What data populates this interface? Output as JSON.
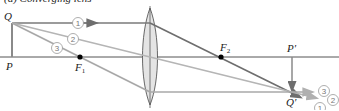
{
  "title": "(a) Converging lens",
  "labels": {
    "Q": "Q",
    "P": "P",
    "F1": "F",
    "F1_sub": "1",
    "F2": "F",
    "F2_sub": "2",
    "P_prime": "P′",
    "Q_prime": "Q′"
  },
  "rays": [
    {
      "id": "1",
      "label": "1",
      "color": "#7a7a7a"
    },
    {
      "id": "2",
      "label": "2",
      "color": "#b5b5b5"
    },
    {
      "id": "3",
      "label": "3",
      "color": "#a8a8a8"
    }
  ],
  "colors": {
    "axis": "#555555",
    "lens_fill": "#e4e4e4",
    "lens_stroke": "#444444",
    "object": "#8a8a8a",
    "image": "#8a8a8a",
    "focal_point": "#000000"
  }
}
